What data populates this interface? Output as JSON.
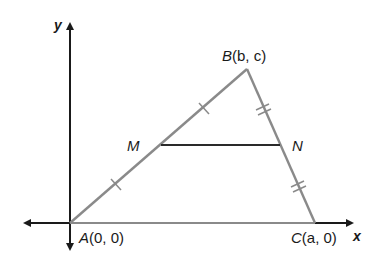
{
  "diagram": {
    "axes": {
      "x_label": "x",
      "y_label": "y"
    },
    "points": {
      "A": {
        "name": "A",
        "coords": "(0, 0)"
      },
      "B": {
        "name": "B",
        "coords": "(b, c)"
      },
      "C": {
        "name": "C",
        "coords": "(a, 0)"
      },
      "M": {
        "name": "M"
      },
      "N": {
        "name": "N"
      }
    },
    "colors": {
      "axis": "#1a1a1a",
      "triangle": "#8a8a8a",
      "midsegment": "#2a2a2a"
    },
    "tick_marks": {
      "AB": "single",
      "BC": "double"
    }
  }
}
